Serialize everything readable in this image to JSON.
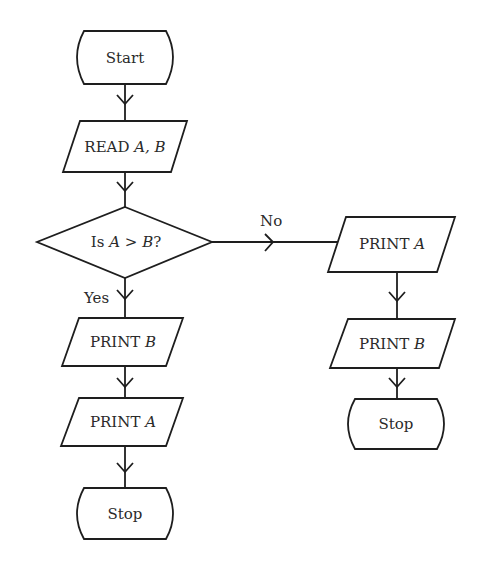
{
  "diagram": {
    "type": "flowchart",
    "nodes": {
      "start": {
        "kind": "terminal",
        "label": "Start"
      },
      "read": {
        "kind": "io",
        "prefix": "READ ",
        "vars": "A, B"
      },
      "decision": {
        "kind": "decision",
        "prefix": "Is ",
        "var1": "A",
        "op": " > ",
        "var2": "B",
        "suffix": "?"
      },
      "print_b_left": {
        "kind": "io",
        "prefix": "PRINT ",
        "var": "B"
      },
      "print_a_left": {
        "kind": "io",
        "prefix": "PRINT ",
        "var": "A"
      },
      "stop_left": {
        "kind": "terminal",
        "label": "Stop"
      },
      "print_a_right": {
        "kind": "io",
        "prefix": "PRINT ",
        "var": "A"
      },
      "print_b_right": {
        "kind": "io",
        "prefix": "PRINT ",
        "var": "B"
      },
      "stop_right": {
        "kind": "terminal",
        "label": "Stop"
      }
    },
    "edges": {
      "yes_label": "Yes",
      "no_label": "No"
    },
    "colors": {
      "stroke": "#1e1e1e",
      "text": "#2a2a2a",
      "background": "#ffffff"
    }
  }
}
